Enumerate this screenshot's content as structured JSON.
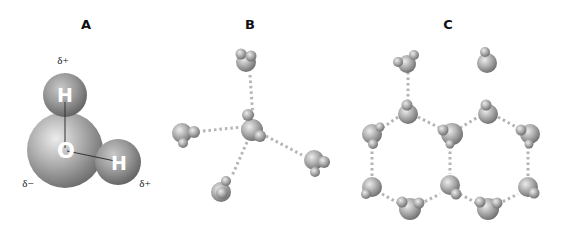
{
  "panels": [
    {
      "id": "A",
      "label": "A",
      "description": "Single water molecule with partial charges"
    },
    {
      "id": "B",
      "label": "B",
      "description": "Tetrahedral hydrogen bonding of water molecules"
    },
    {
      "id": "C",
      "label": "C",
      "description": "Hexagonal ice lattice of water molecules"
    }
  ],
  "molecule_A": {
    "oxygen_label": "O",
    "hydrogen_labels": [
      "H",
      "H"
    ],
    "charges": {
      "top_hydrogen": "δ+",
      "right_hydrogen": "δ+",
      "oxygen": "δ−"
    }
  },
  "colors": {
    "atom_light": "#e6e6e6",
    "atom_mid": "#a6a6a6",
    "atom_dark": "#6e6e6e",
    "hydrogen_bond": "#b5b5b5",
    "label": "#111111"
  }
}
